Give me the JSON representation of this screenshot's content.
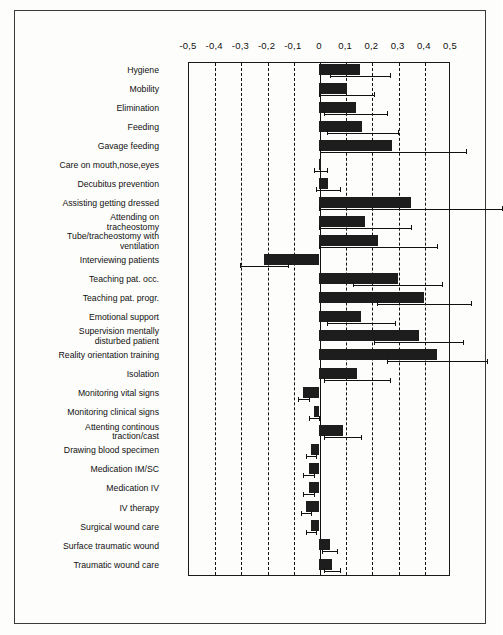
{
  "chart_data": {
    "type": "bar",
    "orientation": "horizontal",
    "title": "",
    "xlabel": "",
    "ylabel": "",
    "xlim": [
      -0.5,
      0.5
    ],
    "grid": true,
    "legend": null,
    "decimal_separator": ",",
    "xticks": [
      -0.5,
      -0.4,
      -0.3,
      -0.2,
      -0.1,
      0,
      0.1,
      0.2,
      0.3,
      0.4,
      0.5
    ],
    "xticklabels": [
      "-0,5",
      "-0,4",
      "-0,3",
      "-0,2",
      "-0,1",
      "0",
      "0,1",
      "0,2",
      "0,3",
      "0,4",
      "0,5"
    ],
    "categories": [
      "Hygiene",
      "Mobility",
      "Elimination",
      "Feeding",
      "Gavage feeding",
      "Care on mouth,nose,eyes",
      "Decubitus prevention",
      "Assisting getting dressed",
      "Attending on tracheostomy",
      "Tube/tracheostomy with ventilation",
      "Interviewing patients",
      "Teaching pat. occ.",
      "Teaching pat. progr.",
      "Emotional support",
      "Supervision mentally disturbed patient",
      "Reality orientation training",
      "Isolation",
      "Monitoring vital signs",
      "Monitoring clinical signs",
      "Attenting continous traction/cast",
      "Drawing blood specimen",
      "Medication IM/SC",
      "Medication IV",
      "IV therapy",
      "Surgical wound care",
      "Surface traumatic wound",
      "Traumatic wound care"
    ],
    "values": [
      0.155,
      0.105,
      0.14,
      0.165,
      0.28,
      0.005,
      0.035,
      0.35,
      0.175,
      0.225,
      -0.21,
      0.3,
      0.4,
      0.16,
      0.38,
      0.45,
      0.145,
      -0.06,
      -0.02,
      0.09,
      -0.03,
      -0.04,
      -0.04,
      -0.05,
      -0.03,
      0.04,
      0.05
    ],
    "error_low": [
      0.04,
      0.0,
      0.02,
      0.03,
      0.005,
      -0.02,
      -0.01,
      0.0,
      0.0,
      0.0,
      -0.3,
      0.13,
      0.22,
      0.03,
      0.21,
      0.26,
      0.02,
      -0.08,
      -0.04,
      0.02,
      -0.05,
      -0.06,
      -0.06,
      -0.07,
      -0.05,
      0.01,
      0.02
    ],
    "error_high": [
      0.27,
      0.21,
      0.26,
      0.3,
      0.56,
      0.03,
      0.08,
      0.7,
      0.35,
      0.45,
      -0.12,
      0.47,
      0.58,
      0.29,
      0.55,
      0.64,
      0.27,
      -0.04,
      0.0,
      0.16,
      -0.01,
      -0.02,
      -0.02,
      -0.03,
      -0.01,
      0.07,
      0.08
    ]
  },
  "labels": {
    "row_lines": [
      [
        "Hygiene"
      ],
      [
        "Mobility"
      ],
      [
        "Elimination"
      ],
      [
        "Feeding"
      ],
      [
        "Gavage feeding"
      ],
      [
        "Care on mouth,nose,eyes"
      ],
      [
        "Decubitus prevention"
      ],
      [
        "Assisting getting dressed"
      ],
      [
        "Attending on",
        "tracheostomy"
      ],
      [
        "Tube/tracheostomy with",
        "ventilation"
      ],
      [
        "Interviewing patients"
      ],
      [
        "Teaching pat. occ."
      ],
      [
        "Teaching pat. progr."
      ],
      [
        "Emotional support"
      ],
      [
        "Supervision mentally",
        "disturbed patient"
      ],
      [
        "Reality orientation training"
      ],
      [
        "Isolation"
      ],
      [
        "Monitoring vital signs"
      ],
      [
        "Monitoring clinical signs"
      ],
      [
        "Attenting continous",
        "traction/cast"
      ],
      [
        "Drawing blood specimen"
      ],
      [
        "Medication IM/SC"
      ],
      [
        "Medication IV"
      ],
      [
        "IV therapy"
      ],
      [
        "Surgical wound care"
      ],
      [
        "Surface traumatic wound"
      ],
      [
        "Traumatic wound care"
      ]
    ]
  },
  "colors": {
    "bar": "#1d1d1d",
    "grid": "#111111",
    "axis": "#1a1a1a",
    "background": "#fdfdfb"
  }
}
